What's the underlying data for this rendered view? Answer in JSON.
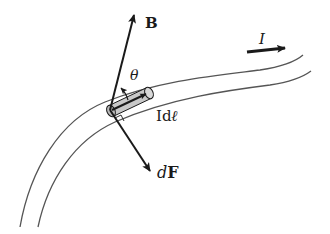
{
  "diagram": {
    "labels": {
      "field": "B",
      "angle": "θ",
      "current": "I",
      "element_prefix": "Id",
      "element_symbol": "ℓ",
      "force_prefix": "d",
      "force_symbol": "F"
    },
    "colors": {
      "stroke": "#1a1a1a",
      "wire": "#555555",
      "element_fill": "#c8c8c8"
    },
    "elements": [
      {
        "id": "wire",
        "type": "curved conductor (two parallel curves)"
      },
      {
        "id": "current-element",
        "type": "shaded cylinder segment on wire"
      },
      {
        "id": "B-vector",
        "label": "B",
        "direction": "up-right"
      },
      {
        "id": "dF-vector",
        "label": "dF",
        "direction": "down-right"
      },
      {
        "id": "Idl-vector",
        "label": "Idℓ",
        "direction": "along wire"
      },
      {
        "id": "current-arrow",
        "label": "I",
        "direction": "right"
      },
      {
        "id": "angle-theta",
        "label": "θ",
        "between": [
          "Idℓ",
          "B"
        ]
      }
    ]
  }
}
